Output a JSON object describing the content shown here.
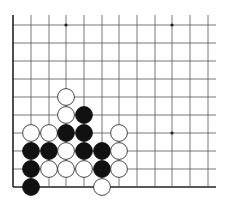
{
  "diagram": {
    "type": "go-board-fragment",
    "colors": {
      "background": "#ffffff",
      "line": "#555555",
      "edge": "#222222",
      "black_stone": "#111111",
      "white_stone": "#ffffff",
      "white_stroke": "#333333"
    },
    "grid": {
      "col_x": [
        13,
        31,
        49,
        66,
        84,
        102,
        119,
        137,
        155,
        172,
        190,
        208
      ],
      "row_y": [
        25,
        43,
        61,
        79,
        97,
        115,
        133,
        151,
        169,
        187
      ],
      "left_edge": true,
      "bottom_edge": true,
      "top_extent": 15,
      "right_extent": 216
    },
    "star_points": [
      [
        3,
        0
      ],
      [
        9,
        0
      ],
      [
        9,
        6
      ]
    ],
    "stones": [
      {
        "color": "white",
        "col": 3,
        "row": 4
      },
      {
        "color": "white",
        "col": 3,
        "row": 5
      },
      {
        "color": "black",
        "col": 4,
        "row": 5
      },
      {
        "color": "white",
        "col": 1,
        "row": 6
      },
      {
        "color": "white",
        "col": 2,
        "row": 6
      },
      {
        "color": "black",
        "col": 3,
        "row": 6
      },
      {
        "color": "black",
        "col": 4,
        "row": 6
      },
      {
        "color": "white",
        "col": 6,
        "row": 6
      },
      {
        "color": "black",
        "col": 1,
        "row": 7
      },
      {
        "color": "black",
        "col": 2,
        "row": 7
      },
      {
        "color": "white",
        "col": 3,
        "row": 7
      },
      {
        "color": "black",
        "col": 4,
        "row": 7
      },
      {
        "color": "black",
        "col": 5,
        "row": 7
      },
      {
        "color": "white",
        "col": 6,
        "row": 7
      },
      {
        "color": "black",
        "col": 1,
        "row": 8
      },
      {
        "color": "white",
        "col": 2,
        "row": 8
      },
      {
        "color": "white",
        "col": 3,
        "row": 8
      },
      {
        "color": "white",
        "col": 4,
        "row": 8
      },
      {
        "color": "black",
        "col": 5,
        "row": 8
      },
      {
        "color": "white",
        "col": 6,
        "row": 8
      },
      {
        "color": "black",
        "col": 1,
        "row": 9
      },
      {
        "color": "white",
        "col": 5,
        "row": 9
      }
    ]
  }
}
